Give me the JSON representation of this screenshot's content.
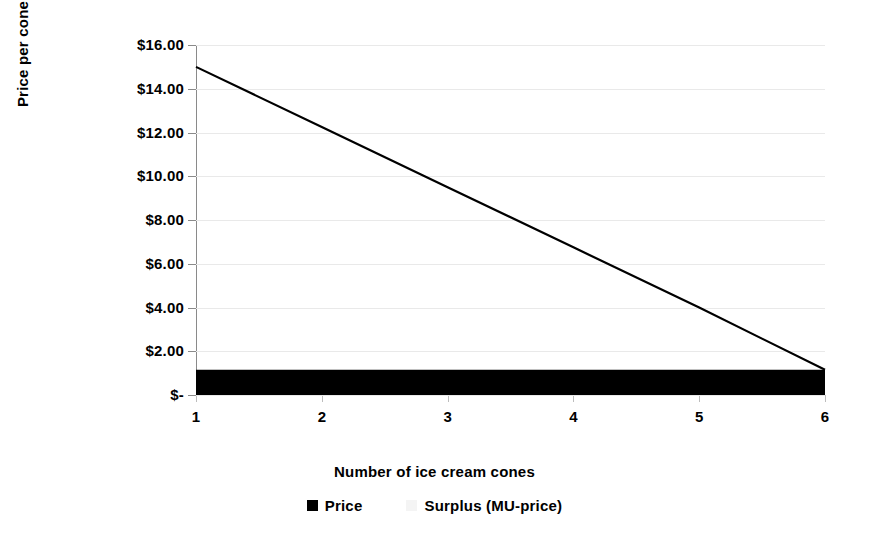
{
  "chart_data": {
    "type": "bar",
    "title": "",
    "subtitle": "",
    "xlabel": "Number of ice cream cones",
    "ylabel": "Price per cone",
    "categories": [
      "1",
      "2",
      "3",
      "4",
      "5",
      "6"
    ],
    "series": [
      {
        "name": "Price",
        "render": "area-bar",
        "color": "#000000",
        "values": [
          1.15,
          1.15,
          1.15,
          1.15,
          1.15,
          1.15
        ]
      },
      {
        "name": "Surplus (MU-price)",
        "render": "line",
        "color": "#000000",
        "values": [
          15.0,
          12.25,
          9.5,
          6.75,
          4.0,
          1.15
        ]
      }
    ],
    "ylim": [
      0,
      16
    ],
    "ytick_values": [
      0,
      2,
      4,
      6,
      8,
      10,
      12,
      14,
      16
    ],
    "ytick_labels": [
      "$-",
      "$2.00",
      "$4.00",
      "$6.00",
      "$8.00",
      "$10.00",
      "$12.00",
      "$14.00",
      "$16.00"
    ],
    "grid": true,
    "grid_color": "#e9e9e9",
    "legend_position": "bottom",
    "background": "#ffffff",
    "axis_color": "#8a8a8a"
  },
  "legend": {
    "entries": [
      {
        "label": "Price",
        "swatch": "black-square-icon"
      },
      {
        "label": "Surplus (MU-price)",
        "swatch": "light-square-icon"
      }
    ]
  }
}
